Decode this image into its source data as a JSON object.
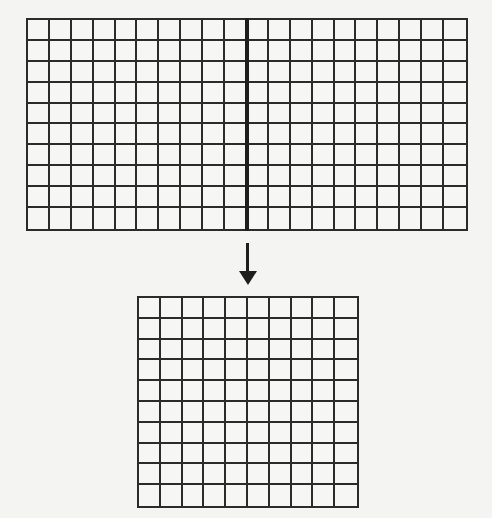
{
  "diagram": {
    "colors": {
      "background": "#f4f4f3",
      "grid_line": "#2b2b2b",
      "divider": "#1e1e1e",
      "arrow": "#1e1e1e"
    },
    "top_grid": {
      "rows": 10,
      "cols": 20,
      "divider_after_col": 10
    },
    "arrow": {
      "direction": "down"
    },
    "bottom_grid": {
      "rows": 10,
      "cols": 10
    }
  }
}
